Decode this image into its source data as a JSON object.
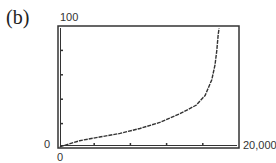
{
  "panel_label": "(b)",
  "chart_data": {
    "type": "line",
    "title": "",
    "xlabel": "",
    "ylabel": "",
    "xlim": [
      0,
      20000
    ],
    "ylim": [
      0,
      100
    ],
    "x_tick_labels": [
      "0",
      "20,000"
    ],
    "y_tick_labels": [
      "0",
      "100"
    ],
    "x_ticks_count": 5,
    "y_ticks_count": 5,
    "grid": false,
    "legend": null,
    "series": [
      {
        "name": "curve",
        "x": [
          200,
          2400,
          4600,
          6850,
          9050,
          11250,
          13450,
          15250,
          16250,
          17000,
          17350,
          17550,
          17700,
          17800
        ],
        "y": [
          1,
          6,
          9,
          12,
          16,
          21,
          28,
          35,
          43,
          56,
          68,
          80,
          93,
          98
        ]
      }
    ]
  },
  "axis_labels": {
    "y_max": "100",
    "y_min": "0",
    "x_min": "0",
    "x_max": "20,000"
  }
}
